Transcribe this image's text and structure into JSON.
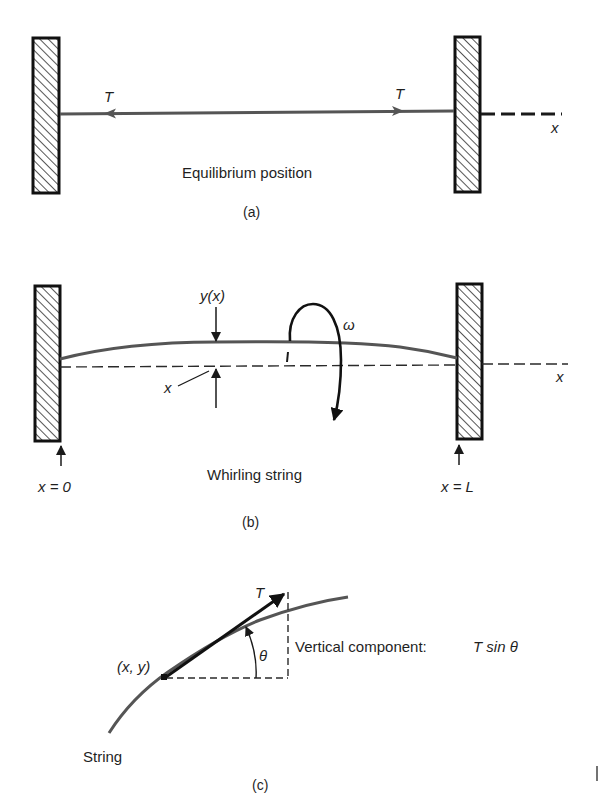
{
  "figure": {
    "colors": {
      "ink": "#1a1a1a",
      "string": "#555555",
      "background": "#ffffff"
    },
    "panel_a": {
      "caption": "(a)",
      "title": "Equilibrium position",
      "tension_left_label": "T",
      "tension_right_label": "T",
      "axis_label": "x"
    },
    "panel_b": {
      "caption": "(b)",
      "title": "Whirling string",
      "displacement_label": "y(x)",
      "position_label": "x",
      "angular_velocity_label": "ω",
      "axis_label": "x",
      "left_end_label": "x = 0",
      "right_end_label": "x = L"
    },
    "panel_c": {
      "caption": "(c)",
      "point_label": "(x, y)",
      "tension_label": "T",
      "angle_label": "θ",
      "component_label": "Vertical component:",
      "component_formula": "T sin θ",
      "string_label": "String"
    }
  }
}
